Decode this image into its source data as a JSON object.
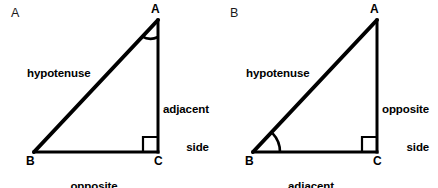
{
  "figure": {
    "background_color": "#ffffff",
    "stroke_color": "#000000"
  },
  "panels": [
    {
      "id": "A",
      "letter": "A",
      "reference_angle_vertex": "A",
      "right_angle_vertex": "C",
      "vertices": {
        "apex": "A",
        "left": "B",
        "right": "C"
      },
      "labels": {
        "hypotenuse": "hypotenuse",
        "vertical_side_line1": "adjacent",
        "vertical_side_line2": "side",
        "base_side_line1": "opposite",
        "base_side_line2": "side"
      },
      "geometry": {
        "apex": [
          158,
          20
        ],
        "left": [
          34,
          152
        ],
        "right": [
          158,
          152
        ],
        "right_angle_box_size": 15,
        "angle_arc_at": "A",
        "angle_arc_radius": 17
      }
    },
    {
      "id": "B",
      "letter": "B",
      "reference_angle_vertex": "B",
      "right_angle_vertex": "C",
      "vertices": {
        "apex": "A",
        "left": "B",
        "right": "C"
      },
      "labels": {
        "hypotenuse": "hypotenuse",
        "vertical_side_line1": "opposite",
        "vertical_side_line2": "side",
        "base_side_line1": "adjacent",
        "base_side_line2": "side"
      },
      "geometry": {
        "apex": [
          158,
          20
        ],
        "left": [
          34,
          152
        ],
        "right": [
          158,
          152
        ],
        "right_angle_box_size": 15,
        "angle_arc_at": "B",
        "angle_arc_radius": 27
      }
    }
  ]
}
